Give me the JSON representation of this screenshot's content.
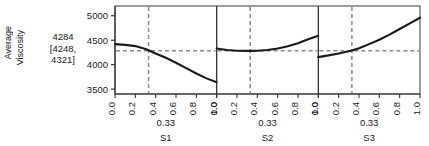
{
  "axis_title": {
    "line1": "Average",
    "line2": "Viscosity"
  },
  "response": {
    "estimate": "4284",
    "ci_lower": "[4248,",
    "ci_upper": "4321]"
  },
  "colors": {
    "curve": "#1a1a1a",
    "reference": "#8c8c8c",
    "frame": "#4d4d4d",
    "background": "#ffffff"
  },
  "chart_data": {
    "type": "line",
    "title": "",
    "subtitle": "",
    "ylabel": "Average Viscosity",
    "xlabel": "",
    "grid": false,
    "legend": "none",
    "ylim": [
      3400,
      5200
    ],
    "yticks": [
      "3500",
      "4000",
      "4500",
      "5000"
    ],
    "ytick_values": [
      3500,
      4000,
      4500,
      5000
    ],
    "xlim": [
      0.0,
      1.0
    ],
    "xticks": [
      "0.0",
      "0.2",
      "0.4",
      "0.6",
      "0.8",
      "1.0"
    ],
    "xtick_values": [
      0.0,
      0.2,
      0.4,
      0.6,
      0.8,
      1.0
    ],
    "reference_y": 4284,
    "panels": [
      {
        "name": "S1",
        "current_setting": "0.33",
        "current_value": 0.33,
        "x": [
          0.0,
          0.1,
          0.2,
          0.3,
          0.33,
          0.4,
          0.5,
          0.6,
          0.7,
          0.8,
          0.9,
          1.0
        ],
        "y": [
          4420,
          4405,
          4380,
          4320,
          4295,
          4230,
          4140,
          4040,
          3930,
          3820,
          3720,
          3640
        ]
      },
      {
        "name": "S2",
        "current_setting": "0.33",
        "current_value": 0.33,
        "x": [
          0.0,
          0.1,
          0.2,
          0.3,
          0.33,
          0.4,
          0.5,
          0.6,
          0.7,
          0.8,
          0.9,
          1.0
        ],
        "y": [
          4330,
          4300,
          4285,
          4282,
          4282,
          4285,
          4300,
          4330,
          4375,
          4440,
          4520,
          4590
        ]
      },
      {
        "name": "S3",
        "current_setting": "0.33",
        "current_value": 0.33,
        "x": [
          0.0,
          0.1,
          0.2,
          0.3,
          0.33,
          0.4,
          0.5,
          0.6,
          0.7,
          0.8,
          0.9,
          1.0
        ],
        "y": [
          4155,
          4190,
          4230,
          4275,
          4290,
          4335,
          4420,
          4510,
          4615,
          4730,
          4845,
          4960
        ]
      }
    ]
  }
}
